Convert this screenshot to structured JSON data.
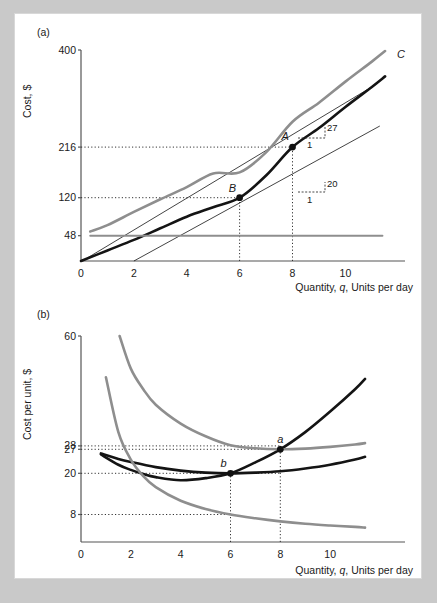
{
  "figure": {
    "background_color": "#c9c9c9",
    "card_color": "#ffffff",
    "panels": [
      {
        "tag": "(a)",
        "y_axis_title": "Cost, $",
        "x_axis_title": "Quantity, q, Units per day"
      },
      {
        "tag": "(b)",
        "y_axis_title": "Cost per unit, $",
        "x_axis_title": "Quantity, q, Units per day"
      }
    ]
  },
  "chart_data": [
    {
      "type": "line",
      "panel": "(a)",
      "title": "",
      "xlabel": "Quantity, q, Units per day",
      "ylabel": "Cost, $",
      "xlim": [
        0,
        11.8
      ],
      "ylim": [
        0,
        400
      ],
      "grid": false,
      "legend_position": "right-of-curve-end",
      "x_ticks": [
        0,
        2,
        4,
        6,
        8,
        10
      ],
      "x_tick_labels": [
        "0",
        "2",
        "4",
        "6",
        "8",
        "10"
      ],
      "y_ticks": [
        48,
        120,
        216,
        400
      ],
      "y_tick_labels": [
        "48",
        "120",
        "216",
        "400"
      ],
      "series": [
        {
          "name": "C",
          "label": "C",
          "color": "#8e8e8e",
          "width": 2.6,
          "description": "Total cost = VC + 48",
          "x": [
            0.35,
            1,
            2,
            3,
            4,
            5,
            6,
            7,
            8,
            9,
            10,
            11,
            11.5
          ],
          "values": [
            56,
            68,
            93,
            117,
            140,
            166,
            168,
            206,
            264,
            300,
            340,
            378,
            398
          ]
        },
        {
          "name": "VC",
          "label": "VC",
          "color": "#141414",
          "width": 2.6,
          "description": "Variable cost curve through B(6,120) and A(8,216)",
          "x": [
            0,
            1,
            2,
            3,
            4,
            5,
            6,
            7,
            8,
            9,
            10,
            11,
            11.5
          ],
          "values": [
            0,
            20,
            40,
            62,
            84,
            102,
            120,
            162,
            216,
            252,
            292,
            330,
            350
          ]
        },
        {
          "name": "F",
          "label": "F",
          "color": "#8e8e8e",
          "width": 2.0,
          "description": "Fixed cost, constant at 48",
          "x": [
            0.35,
            11.4
          ],
          "values": [
            48,
            48
          ]
        }
      ],
      "points": [
        {
          "label": "A",
          "x": 8,
          "y": 216,
          "on": "VC"
        },
        {
          "label": "B",
          "x": 6,
          "y": 120,
          "on": "VC"
        }
      ],
      "guides": {
        "vertical_at": [
          6,
          8
        ],
        "horizontal_at": [
          120,
          216
        ]
      },
      "annotations": [
        {
          "label": "27",
          "denominator": "1",
          "at_x": 9.1,
          "at_y": 262,
          "meaning": "slope of C at q=8"
        },
        {
          "label": "20",
          "denominator": "1",
          "at_x": 9.1,
          "at_y": 156,
          "meaning": "slope of ray/line, 20 per unit"
        }
      ]
    },
    {
      "type": "line",
      "panel": "(b)",
      "title": "",
      "xlabel": "Quantity, q, Units per day",
      "ylabel": "Cost per unit, $",
      "xlim": [
        0,
        11.8
      ],
      "ylim": [
        0,
        60
      ],
      "grid": false,
      "legend_position": "right-of-curve-end",
      "x_ticks": [
        0,
        2,
        4,
        6,
        8,
        10
      ],
      "x_tick_labels": [
        "0",
        "2",
        "4",
        "6",
        "8",
        "10"
      ],
      "y_ticks": [
        8,
        20,
        27,
        28,
        60
      ],
      "y_tick_labels": [
        "8",
        "20",
        "27",
        "28",
        "60"
      ],
      "series": [
        {
          "name": "MC",
          "label": "MC",
          "color": "#141414",
          "width": 2.6,
          "description": "Marginal cost; crosses AVC min at b(6,20) and AC min at a(8,27)",
          "x": [
            0.8,
            1.5,
            2,
            2.5,
            3,
            4,
            5,
            6,
            7,
            8,
            9,
            10,
            11,
            11.4
          ],
          "values": [
            25.5,
            22.5,
            21,
            19.8,
            18.9,
            18,
            18.6,
            20,
            23.2,
            27,
            32,
            38,
            44.5,
            47.5
          ]
        },
        {
          "name": "AVC",
          "label": "AVC",
          "color": "#141414",
          "width": 2.6,
          "description": "Average variable cost, minimum 20 at q=6",
          "x": [
            0.8,
            1.5,
            2,
            3,
            4,
            5,
            6,
            7,
            8,
            9,
            10,
            11,
            11.4
          ],
          "values": [
            25.8,
            24.2,
            23.3,
            21.8,
            20.8,
            20.2,
            20,
            20.2,
            20.6,
            21.4,
            22.5,
            24,
            24.8
          ]
        },
        {
          "name": "AC",
          "label": "AC",
          "color": "#8e8e8e",
          "width": 2.6,
          "description": "Average total cost, minimum 27 at q=8",
          "x": [
            1.55,
            2,
            2.5,
            3,
            4,
            5,
            6,
            7,
            8,
            9,
            10,
            11,
            11.4
          ],
          "values": [
            60,
            50.5,
            44.5,
            40,
            34.5,
            30.8,
            28.2,
            27.3,
            27,
            27.2,
            27.7,
            28.4,
            28.8
          ]
        },
        {
          "name": "AFC",
          "label": "AFC",
          "color": "#8e8e8e",
          "width": 2.6,
          "description": "Average fixed cost = 48/q",
          "x": [
            1,
            1.5,
            2,
            2.5,
            3,
            4,
            5,
            6,
            7,
            8,
            9,
            10,
            11,
            11.4
          ],
          "values": [
            48,
            32,
            24,
            19.2,
            16,
            12,
            9.6,
            8,
            6.9,
            6,
            5.3,
            4.8,
            4.4,
            4.2
          ]
        }
      ],
      "points": [
        {
          "label": "a",
          "x": 8,
          "y": 27,
          "on": "MC-AC"
        },
        {
          "label": "b",
          "x": 6,
          "y": 20,
          "on": "MC-AVC"
        }
      ],
      "guides": {
        "vertical_at": [
          6,
          8
        ],
        "horizontal_at": [
          8,
          20,
          27,
          28
        ]
      },
      "annotations": []
    }
  ]
}
